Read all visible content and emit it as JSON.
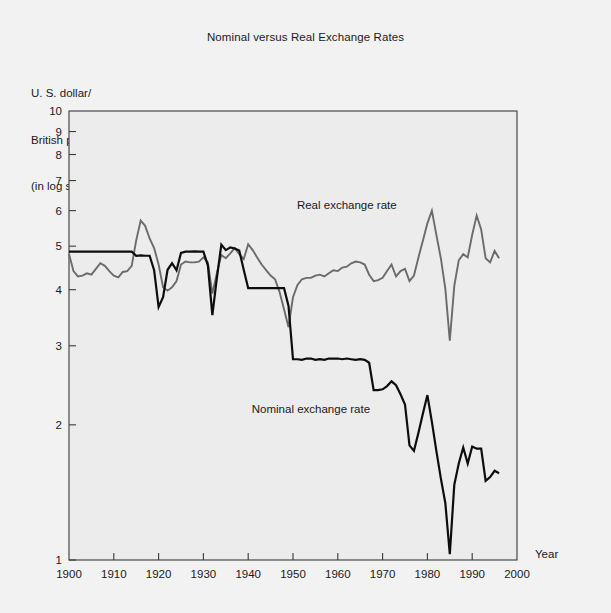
{
  "chart_data": {
    "type": "line",
    "title": "Nominal versus Real Exchange Rates",
    "ylabel_lines": [
      "U. S. dollar/",
      "British pound",
      "(in log scale)"
    ],
    "xlabel": "Year",
    "yscale": "log",
    "ylim": [
      1,
      10
    ],
    "xlim": [
      1900,
      2000
    ],
    "ytick_labels": [
      "1",
      "2",
      "3",
      "4",
      "5",
      "6",
      "7",
      "8",
      "9",
      "10"
    ],
    "yticks": [
      1,
      2,
      3,
      4,
      5,
      6,
      7,
      8,
      9,
      10
    ],
    "xticks": [
      1900,
      1910,
      1920,
      1930,
      1940,
      1950,
      1960,
      1970,
      1980,
      1990,
      2000
    ],
    "xtick_labels": [
      "1900",
      "1910",
      "1920",
      "1930",
      "1940",
      "1950",
      "1960",
      "1970",
      "1980",
      "1990",
      "2000"
    ],
    "grid": false,
    "legend_position": "inline-annotation",
    "colors": {
      "real": "#6b6b6b",
      "nominal": "#0d0d0d",
      "frame": "#3a3a3a",
      "plot_bg": "#ececec",
      "figure_bg": "#f2f2f2"
    },
    "annotations": [
      {
        "text": "Real exchange rate",
        "x": 1962,
        "y": 6.05,
        "series": "real"
      },
      {
        "text": "Nominal exchange rate",
        "x": 1954,
        "y": 2.12,
        "series": "nominal"
      }
    ],
    "series": [
      {
        "name": "Real exchange rate",
        "color": "#6b6b6b",
        "x": [
          1900,
          1901,
          1902,
          1903,
          1904,
          1905,
          1906,
          1907,
          1908,
          1909,
          1910,
          1911,
          1912,
          1913,
          1914,
          1915,
          1916,
          1917,
          1918,
          1919,
          1920,
          1921,
          1922,
          1923,
          1924,
          1925,
          1926,
          1927,
          1928,
          1929,
          1930,
          1931,
          1932,
          1933,
          1934,
          1935,
          1936,
          1937,
          1938,
          1939,
          1940,
          1941,
          1942,
          1943,
          1944,
          1945,
          1946,
          1947,
          1948,
          1949,
          1950,
          1951,
          1952,
          1953,
          1954,
          1955,
          1956,
          1957,
          1958,
          1959,
          1960,
          1961,
          1962,
          1963,
          1964,
          1965,
          1966,
          1967,
          1968,
          1969,
          1970,
          1971,
          1972,
          1973,
          1974,
          1975,
          1976,
          1977,
          1978,
          1979,
          1980,
          1981,
          1982,
          1983,
          1984,
          1985,
          1986,
          1987,
          1988,
          1989,
          1990,
          1991,
          1992,
          1993,
          1994,
          1995,
          1996
        ],
        "values": [
          4.8,
          4.4,
          4.28,
          4.3,
          4.35,
          4.32,
          4.45,
          4.58,
          4.52,
          4.4,
          4.3,
          4.26,
          4.38,
          4.4,
          4.52,
          5.15,
          5.7,
          5.55,
          5.2,
          4.95,
          4.55,
          4.05,
          3.98,
          4.05,
          4.18,
          4.55,
          4.62,
          4.6,
          4.6,
          4.62,
          4.72,
          4.6,
          3.92,
          4.35,
          4.78,
          4.7,
          4.82,
          4.95,
          4.8,
          4.68,
          5.05,
          4.9,
          4.72,
          4.55,
          4.42,
          4.3,
          4.22,
          3.95,
          3.62,
          3.3,
          3.85,
          4.1,
          4.22,
          4.25,
          4.25,
          4.3,
          4.32,
          4.28,
          4.35,
          4.42,
          4.4,
          4.48,
          4.5,
          4.58,
          4.62,
          4.6,
          4.55,
          4.32,
          4.18,
          4.2,
          4.25,
          4.4,
          4.55,
          4.28,
          4.4,
          4.45,
          4.18,
          4.3,
          4.72,
          5.15,
          5.62,
          6.0,
          5.3,
          4.7,
          4.02,
          3.08,
          4.08,
          4.65,
          4.8,
          4.72,
          5.3,
          5.85,
          5.45,
          4.7,
          4.6,
          4.88,
          4.7
        ]
      },
      {
        "name": "Nominal exchange rate",
        "color": "#0d0d0d",
        "x": [
          1900,
          1901,
          1902,
          1903,
          1904,
          1905,
          1906,
          1907,
          1908,
          1909,
          1910,
          1911,
          1912,
          1913,
          1914,
          1915,
          1916,
          1917,
          1918,
          1919,
          1920,
          1921,
          1922,
          1923,
          1924,
          1925,
          1926,
          1927,
          1928,
          1929,
          1930,
          1931,
          1932,
          1933,
          1934,
          1935,
          1936,
          1937,
          1938,
          1939,
          1940,
          1941,
          1942,
          1943,
          1944,
          1945,
          1946,
          1947,
          1948,
          1949,
          1950,
          1951,
          1952,
          1953,
          1954,
          1955,
          1956,
          1957,
          1958,
          1959,
          1960,
          1961,
          1962,
          1963,
          1964,
          1965,
          1966,
          1967,
          1968,
          1969,
          1970,
          1971,
          1972,
          1973,
          1974,
          1975,
          1976,
          1977,
          1978,
          1979,
          1980,
          1981,
          1982,
          1983,
          1984,
          1985,
          1986,
          1987,
          1988,
          1989,
          1990,
          1991,
          1992,
          1993,
          1994,
          1995,
          1996
        ],
        "values": [
          4.86,
          4.86,
          4.86,
          4.86,
          4.86,
          4.86,
          4.86,
          4.86,
          4.86,
          4.86,
          4.86,
          4.86,
          4.86,
          4.86,
          4.86,
          4.76,
          4.77,
          4.76,
          4.76,
          4.42,
          3.66,
          3.85,
          4.43,
          4.58,
          4.42,
          4.83,
          4.86,
          4.86,
          4.87,
          4.86,
          4.86,
          4.53,
          3.51,
          4.24,
          5.04,
          4.9,
          4.97,
          4.94,
          4.89,
          4.43,
          4.03,
          4.03,
          4.03,
          4.03,
          4.03,
          4.03,
          4.03,
          4.03,
          4.03,
          3.68,
          2.8,
          2.8,
          2.79,
          2.81,
          2.81,
          2.79,
          2.8,
          2.79,
          2.81,
          2.81,
          2.81,
          2.8,
          2.81,
          2.8,
          2.79,
          2.8,
          2.79,
          2.75,
          2.39,
          2.39,
          2.4,
          2.44,
          2.5,
          2.45,
          2.34,
          2.22,
          1.8,
          1.75,
          1.92,
          2.12,
          2.33,
          2.03,
          1.75,
          1.52,
          1.34,
          1.03,
          1.47,
          1.64,
          1.78,
          1.64,
          1.79,
          1.77,
          1.77,
          1.5,
          1.53,
          1.58,
          1.56
        ]
      }
    ]
  }
}
